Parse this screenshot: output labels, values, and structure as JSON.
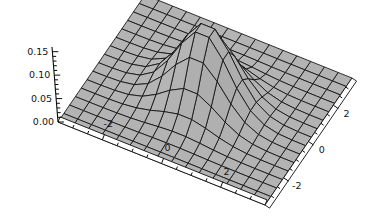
{
  "figure": {
    "kind": "surface-plot-3d",
    "background_color": "#ffffff",
    "mesh_color": "#111111",
    "surface_light_color": "#c8c8c8",
    "surface_dark_color": "#3c3c3c",
    "axis_color": "#0d0d0d"
  },
  "chart_data": {
    "type": "surface",
    "title": "",
    "xlabel": "",
    "ylabel": "",
    "zlabel": "",
    "grid": false,
    "legend": "none",
    "xlim": [
      -3.5,
      3.5
    ],
    "ylim": [
      -3.5,
      3.5
    ],
    "zlim": [
      0.0,
      0.16
    ],
    "x_ticks": [
      -2,
      0,
      2
    ],
    "x_tick_labels": [
      "-2",
      "0",
      "2"
    ],
    "y_ticks": [
      -2,
      0,
      2
    ],
    "y_tick_labels": [
      "-2",
      "0",
      "2"
    ],
    "z_ticks": [
      0.0,
      0.05,
      0.1,
      0.15
    ],
    "z_tick_labels": [
      "0.00",
      "0.05",
      "0.10",
      "0.15"
    ],
    "x_minor_ticks": [
      -3,
      -2.5,
      -1.5,
      -1,
      -0.5,
      0.5,
      1,
      1.5,
      2.5,
      3
    ],
    "y_minor_ticks": [
      -3,
      -2.5,
      -1.5,
      -1,
      -0.5,
      0.5,
      1,
      1.5,
      2.5,
      3
    ],
    "z_minor_ticks": [
      0.01,
      0.02,
      0.03,
      0.04,
      0.06,
      0.07,
      0.08,
      0.09,
      0.11,
      0.12,
      0.13,
      0.14
    ],
    "mesh_divisions": 15,
    "peak_value": 0.159,
    "peak_location": [
      0,
      0
    ],
    "baseline_value": 0.0,
    "surface_description": "single central gaussian-like peak decaying to a flat plane",
    "view": {
      "azimuth_deg": -37,
      "elevation_deg": 24,
      "projection": "parallel"
    },
    "function_note": "z = 0.159 * exp(-(x^2 + y^2)/1.55)"
  },
  "axes": {
    "z_axis": {
      "name": "z-axis",
      "labels": [
        "0.15",
        "0.10",
        "0.05",
        "0.00"
      ]
    },
    "x_axis_front_left": {
      "name": "x-axis",
      "labels": [
        "-2",
        "0",
        "2"
      ]
    },
    "y_axis_front_right": {
      "name": "y-axis",
      "labels": [
        "2",
        "0",
        "-2"
      ]
    }
  }
}
